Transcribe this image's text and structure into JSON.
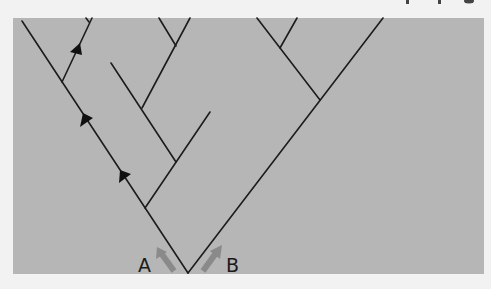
{
  "figure": {
    "type": "phylogenetic-tree",
    "background_color": "#b6b6b6",
    "line_color": "#1c1c1c",
    "labels": {
      "left_lineage": "A",
      "right_lineage": "B"
    },
    "markers": {
      "arrowheads_on_lineage_A": 3,
      "migration_arrows": [
        "A",
        "B"
      ]
    }
  }
}
